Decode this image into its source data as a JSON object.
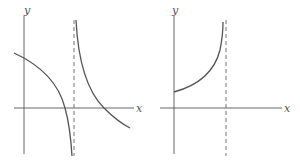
{
  "figures": [
    {
      "id": "left",
      "axis_labels": {
        "x": "x",
        "y": "y"
      },
      "description": "Two branches separated by vertical dashed asymptote; left branch decreasing through x-axis to -infinity, right branch decreasing from +infinity crossing x-axis"
    },
    {
      "id": "right",
      "axis_labels": {
        "x": "x",
        "y": "y"
      },
      "description": "Increasing curve starting at positive y-intercept rising to +infinity at vertical dashed asymptote"
    }
  ],
  "colors": {
    "curve": "#555555",
    "axis": "#555555",
    "asymptote": "#666666"
  }
}
